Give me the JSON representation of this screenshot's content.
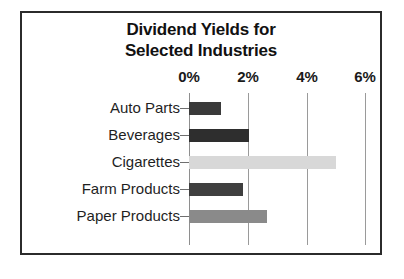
{
  "chart_data": {
    "type": "bar",
    "orientation": "horizontal",
    "title": "Dividend Yields for Selected Industries",
    "title_lines": [
      "Dividend Yields for",
      "Selected Industries"
    ],
    "xlabel": "",
    "ylabel": "",
    "categories": [
      "Auto Parts",
      "Beverages",
      "Cigarettes",
      "Farm Products",
      "Paper Products"
    ],
    "values": [
      1.1,
      2.05,
      5.0,
      1.85,
      2.65
    ],
    "value_unit": "%",
    "xlim": [
      0,
      6
    ],
    "xticks": [
      0,
      2,
      4,
      6
    ],
    "xtick_labels": [
      "0%",
      "2%",
      "4%",
      "6%"
    ],
    "grid": "vertical",
    "legend": "none",
    "bar_colors": [
      "#3a3a3a",
      "#2e2e2e",
      "#d8d8d8",
      "#3f3f3f",
      "#8a8a8a"
    ],
    "series": [
      {
        "name": "Dividend Yield",
        "values": [
          1.1,
          2.05,
          5.0,
          1.85,
          2.65
        ]
      }
    ],
    "bars": [
      {
        "category": "Auto Parts",
        "value": 1.1,
        "color": "#3a3a3a"
      },
      {
        "category": "Beverages",
        "value": 2.05,
        "color": "#2e2e2e"
      },
      {
        "category": "Cigarettes",
        "value": 5.0,
        "color": "#d8d8d8"
      },
      {
        "category": "Farm Products",
        "value": 1.85,
        "color": "#3f3f3f"
      },
      {
        "category": "Paper Products",
        "value": 2.65,
        "color": "#8a8a8a"
      }
    ]
  },
  "frame": {
    "border_color": "#2b2b2b",
    "background": "#ffffff",
    "gridline_color": "#9a9a9a"
  }
}
